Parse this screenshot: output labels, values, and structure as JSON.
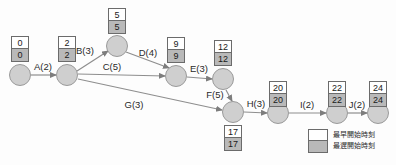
{
  "diagram": {
    "type": "activity-on-arrow-network",
    "nodes": [
      {
        "id": "n1",
        "x": 20,
        "y": 75,
        "es": "0",
        "ls": "0",
        "box_x": 20,
        "box_y": 36
      },
      {
        "id": "n2",
        "x": 67,
        "y": 75,
        "es": "2",
        "ls": "2",
        "box_x": 67,
        "box_y": 36
      },
      {
        "id": "n3",
        "x": 117,
        "y": 46,
        "es": "5",
        "ls": "5",
        "box_x": 117,
        "box_y": 8
      },
      {
        "id": "n4",
        "x": 176,
        "y": 76,
        "es": "9",
        "ls": "9",
        "box_x": 176,
        "box_y": 37
      },
      {
        "id": "n5",
        "x": 223,
        "y": 79,
        "es": "12",
        "ls": "12",
        "box_x": 223,
        "box_y": 40
      },
      {
        "id": "n6",
        "x": 233,
        "y": 112,
        "es": "17",
        "ls": "17",
        "box_x": 233,
        "box_y": 125
      },
      {
        "id": "n7",
        "x": 278,
        "y": 113,
        "es": "20",
        "ls": "20",
        "box_x": 278,
        "box_y": 81
      },
      {
        "id": "n8",
        "x": 337,
        "y": 113,
        "es": "22",
        "ls": "22",
        "box_x": 337,
        "box_y": 81
      },
      {
        "id": "n9",
        "x": 378,
        "y": 113,
        "es": "24",
        "ls": "24",
        "box_x": 378,
        "box_y": 81
      }
    ],
    "edges": [
      {
        "id": "a",
        "label": "A(2)",
        "from": "n1",
        "to": "n2",
        "x1": 31,
        "y1": 75,
        "x2": 56,
        "y2": 75,
        "lx": 43,
        "ly": 66
      },
      {
        "id": "b",
        "label": "B(3)",
        "from": "n2",
        "to": "n3",
        "x1": 77,
        "y1": 71,
        "x2": 108,
        "y2": 51,
        "lx": 85,
        "ly": 50
      },
      {
        "id": "c",
        "label": "C(5)",
        "from": "n2",
        "to": "n4",
        "x1": 78,
        "y1": 74,
        "x2": 165,
        "y2": 76,
        "lx": 112,
        "ly": 66
      },
      {
        "id": "d",
        "label": "D(4)",
        "from": "n3",
        "to": "n4",
        "x1": 126,
        "y1": 52,
        "x2": 169,
        "y2": 68,
        "lx": 148,
        "ly": 52
      },
      {
        "id": "e",
        "label": "E(3)",
        "from": "n4",
        "to": "n5",
        "x1": 187,
        "y1": 77,
        "x2": 212,
        "y2": 79,
        "lx": 199,
        "ly": 68
      },
      {
        "id": "f",
        "label": "F(5)",
        "from": "n5",
        "to": "n6",
        "x1": 226,
        "y1": 90,
        "x2": 232,
        "y2": 101,
        "lx": 215,
        "ly": 94
      },
      {
        "id": "g",
        "label": "G(3)",
        "from": "n2",
        "to": "n6",
        "x1": 78,
        "y1": 79,
        "x2": 222,
        "y2": 110,
        "lx": 134,
        "ly": 104
      },
      {
        "id": "h",
        "label": "H(3)",
        "from": "n6",
        "to": "n7",
        "x1": 244,
        "y1": 112,
        "x2": 267,
        "y2": 113,
        "lx": 256,
        "ly": 103
      },
      {
        "id": "i",
        "label": "I(2)",
        "from": "n7",
        "to": "n8",
        "x1": 289,
        "y1": 113,
        "x2": 326,
        "y2": 113,
        "lx": 307,
        "ly": 104
      },
      {
        "id": "j",
        "label": "J(2)",
        "from": "n8",
        "to": "n9",
        "x1": 348,
        "y1": 113,
        "x2": 367,
        "y2": 113,
        "lx": 357,
        "ly": 104
      }
    ]
  },
  "legend": {
    "earliest_start_label": "最早開始時刻",
    "latest_start_label": "最遅開始時刻"
  },
  "colors": {
    "node_fill": "#cfcfcf",
    "node_stroke": "#9a9a9a",
    "box_stroke": "#6b6b6b",
    "es_fill": "#ffffff",
    "ls_fill": "#b9b9b9",
    "edge_stroke": "#8e8e8e",
    "text": "#2a2a2a"
  }
}
